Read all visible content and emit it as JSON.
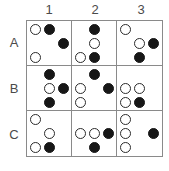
{
  "figure": {
    "type": "matrix-grid",
    "columns": 3,
    "rows": 3,
    "column_headers": [
      "1",
      "2",
      "3"
    ],
    "row_headers": [
      "A",
      "B",
      "C"
    ],
    "colors": {
      "grid_line": "#8a8a8a",
      "open_circle_outline": "#2b2b2b",
      "filled_circle": "#171717",
      "background": "#ffffff",
      "label_text": "#4a4a4a"
    },
    "cells": [
      {
        "id": "A1",
        "row": "A",
        "column": "1",
        "dots": [
          {
            "x": 0,
            "y": 0,
            "fill": "open"
          },
          {
            "x": 1,
            "y": 0,
            "fill": "filled"
          },
          {
            "x": 2,
            "y": 1,
            "fill": "filled"
          },
          {
            "x": 0,
            "y": 2,
            "fill": "open"
          }
        ]
      },
      {
        "id": "A2",
        "row": "A",
        "column": "2",
        "dots": [
          {
            "x": 1,
            "y": 0,
            "fill": "filled"
          },
          {
            "x": 1,
            "y": 1,
            "fill": "open"
          },
          {
            "x": 0,
            "y": 2,
            "fill": "open"
          },
          {
            "x": 1,
            "y": 2,
            "fill": "filled"
          }
        ]
      },
      {
        "id": "A3",
        "row": "A",
        "column": "3",
        "dots": [
          {
            "x": 0,
            "y": 0,
            "fill": "open"
          },
          {
            "x": 1,
            "y": 1,
            "fill": "open"
          },
          {
            "x": 2,
            "y": 1,
            "fill": "filled"
          },
          {
            "x": 1,
            "y": 2,
            "fill": "filled"
          }
        ]
      },
      {
        "id": "B1",
        "row": "B",
        "column": "1",
        "dots": [
          {
            "x": 1,
            "y": 0,
            "fill": "filled"
          },
          {
            "x": 1,
            "y": 1,
            "fill": "open"
          },
          {
            "x": 2,
            "y": 1,
            "fill": "filled"
          },
          {
            "x": 1,
            "y": 2,
            "fill": "filled"
          }
        ]
      },
      {
        "id": "B2",
        "row": "B",
        "column": "2",
        "dots": [
          {
            "x": 1,
            "y": 0,
            "fill": "filled"
          },
          {
            "x": 0,
            "y": 1,
            "fill": "open"
          },
          {
            "x": 2,
            "y": 1,
            "fill": "filled"
          },
          {
            "x": 0,
            "y": 2,
            "fill": "open"
          }
        ]
      },
      {
        "id": "B3",
        "row": "B",
        "column": "3",
        "dots": [
          {
            "x": 0,
            "y": 1,
            "fill": "open"
          },
          {
            "x": 1,
            "y": 1,
            "fill": "open"
          },
          {
            "x": 0,
            "y": 2,
            "fill": "open"
          },
          {
            "x": 1,
            "y": 2,
            "fill": "filled"
          }
        ]
      },
      {
        "id": "C1",
        "row": "C",
        "column": "1",
        "dots": [
          {
            "x": 0,
            "y": 0,
            "fill": "open"
          },
          {
            "x": 1,
            "y": 1,
            "fill": "open"
          },
          {
            "x": 0,
            "y": 2,
            "fill": "open"
          },
          {
            "x": 1,
            "y": 2,
            "fill": "filled"
          }
        ]
      },
      {
        "id": "C2",
        "row": "C",
        "column": "2",
        "dots": [
          {
            "x": 0,
            "y": 1,
            "fill": "open"
          },
          {
            "x": 1,
            "y": 1,
            "fill": "open"
          },
          {
            "x": 2,
            "y": 1,
            "fill": "filled"
          },
          {
            "x": 1,
            "y": 2,
            "fill": "filled"
          }
        ]
      },
      {
        "id": "C3",
        "row": "C",
        "column": "3",
        "dots": [
          {
            "x": 0,
            "y": 0,
            "fill": "open"
          },
          {
            "x": 0,
            "y": 1,
            "fill": "open"
          },
          {
            "x": 2,
            "y": 1,
            "fill": "filled"
          },
          {
            "x": 0,
            "y": 2,
            "fill": "open"
          }
        ]
      }
    ]
  }
}
